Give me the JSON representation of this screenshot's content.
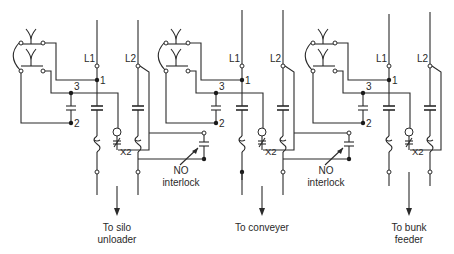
{
  "diagram": {
    "type": "electrical-ladder-schematic",
    "line_labels": {
      "l1": "L1",
      "l2": "L2"
    },
    "node_labels": {
      "n1": "1",
      "n2": "2",
      "n3": "3"
    },
    "auxiliary_label": "X2",
    "interlock_label": {
      "line1": "NO",
      "line2": "interlock"
    },
    "sections": [
      {
        "id": "silo-unloader",
        "destination_line1": "To silo",
        "destination_line2": "unloader",
        "has_interlock": true
      },
      {
        "id": "conveyer",
        "destination_line1": "To conveyer",
        "destination_line2": "",
        "has_interlock": true
      },
      {
        "id": "bunk-feeder",
        "destination_line1": "To bunk",
        "destination_line2": "feeder",
        "has_interlock": false
      }
    ]
  }
}
